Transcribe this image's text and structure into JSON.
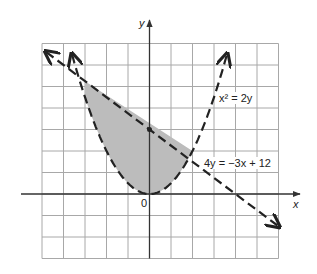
{
  "figure": {
    "type": "inequality-graph",
    "grid": {
      "x_min": -5,
      "x_max": 6,
      "y_min": -3,
      "y_max": 7,
      "step": 1,
      "color": "#a8a8a8"
    },
    "axes": {
      "x_label": "x",
      "y_label": "y",
      "origin_label": "0",
      "color": "#333333"
    },
    "curves": [
      {
        "name": "parabola",
        "equation": "x² = 2y",
        "label": "x² = 2y",
        "style": "dashed",
        "x_range": [
          -3.6,
          3.6
        ]
      },
      {
        "name": "line",
        "equation": "4y = −3x + 12",
        "label": "4y = −3x + 12",
        "style": "dashed",
        "x_range": [
          -4.8,
          6
        ]
      }
    ],
    "intersections": [
      {
        "x": -3,
        "y": 4.5
      },
      {
        "x": 2,
        "y": 2
      }
    ],
    "y_intercept_point": {
      "x": 0,
      "y": 3
    },
    "shaded_region": {
      "description": "between parabola and line, -3 ≤ x ≤ 2",
      "color": "#bcbcbc"
    }
  },
  "labels": {
    "parabola": "x² = 2y",
    "line": "4y = −3x + 12",
    "x_axis": "x",
    "y_axis": "y",
    "origin": "0"
  }
}
